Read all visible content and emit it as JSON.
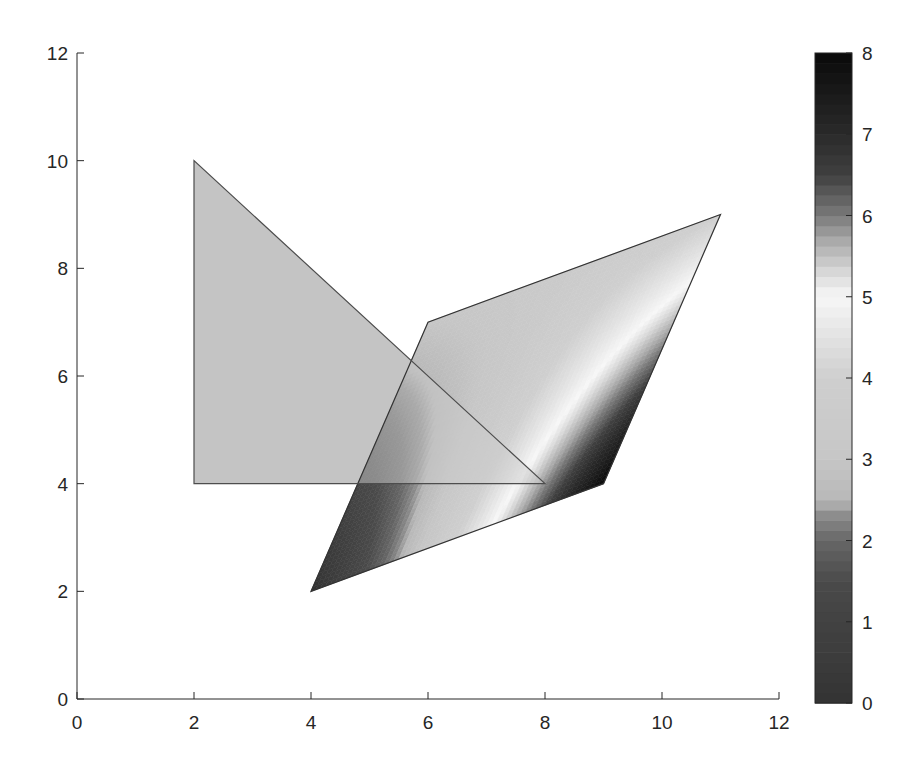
{
  "chart_data": {
    "type": "patch",
    "title": "",
    "xlabel": "",
    "ylabel": "",
    "xlim": [
      0,
      12
    ],
    "ylim": [
      0,
      12
    ],
    "grid": false,
    "xticks": [
      0,
      2,
      4,
      6,
      8,
      10,
      12
    ],
    "yticks": [
      0,
      2,
      4,
      6,
      8,
      10,
      12
    ],
    "xtick_labels": [
      "0",
      "2",
      "4",
      "6",
      "8",
      "10",
      "12"
    ],
    "ytick_labels": [
      "0",
      "2",
      "4",
      "6",
      "8",
      "10",
      "12"
    ],
    "series": [
      {
        "name": "triangle",
        "shape": "polygon",
        "vertices": [
          [
            2,
            4
          ],
          [
            2,
            10
          ],
          [
            8,
            4
          ]
        ],
        "fill": "flat",
        "color_value": 3.5,
        "face_alpha": 0.5,
        "edge_color": "#4d4d4d"
      },
      {
        "name": "parallelogram",
        "shape": "polygon",
        "vertices": [
          [
            4,
            2
          ],
          [
            9,
            4
          ],
          [
            11,
            9
          ],
          [
            6,
            7
          ]
        ],
        "vertex_values": [
          0,
          8,
          4,
          3
        ],
        "fill": "interp",
        "edge_color": "#333333"
      }
    ],
    "colorbar": {
      "position": "right",
      "range": [
        0,
        8
      ],
      "ticks": [
        0,
        1,
        2,
        3,
        4,
        5,
        6,
        7,
        8
      ],
      "tick_labels": [
        "0",
        "1",
        "2",
        "3",
        "4",
        "5",
        "6",
        "7",
        "8"
      ],
      "colormap": [
        [
          0.0,
          "#333333"
        ],
        [
          1.5,
          "#4a4a4a"
        ],
        [
          2.0,
          "#666666"
        ],
        [
          2.3,
          "#8a8a8a"
        ],
        [
          2.5,
          "#b8b8b8"
        ],
        [
          3.0,
          "#c6c6c6"
        ],
        [
          4.0,
          "#cfcfcf"
        ],
        [
          4.6,
          "#e6e6e6"
        ],
        [
          5.0,
          "#f7f7f7"
        ],
        [
          5.3,
          "#d9d9d9"
        ],
        [
          5.7,
          "#a8a8a8"
        ],
        [
          6.0,
          "#7a7a7a"
        ],
        [
          6.5,
          "#404040"
        ],
        [
          7.0,
          "#2a2a2a"
        ],
        [
          8.0,
          "#0a0a0a"
        ]
      ]
    }
  }
}
